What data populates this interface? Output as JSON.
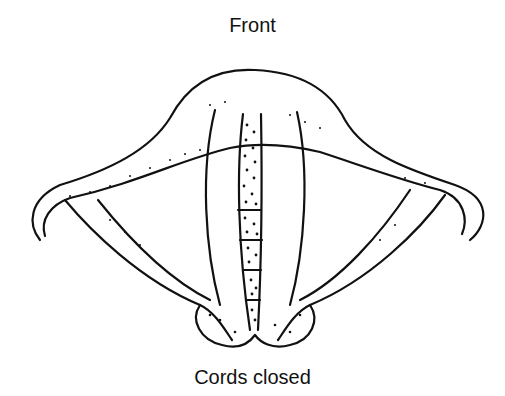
{
  "diagram": {
    "title": "Front",
    "caption": "Cords closed",
    "colors": {
      "line": "#111111",
      "background": "#ffffff"
    }
  }
}
